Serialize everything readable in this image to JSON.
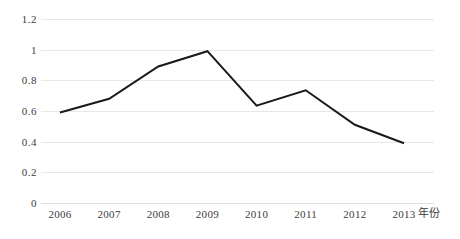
{
  "chart_data": {
    "type": "line",
    "title": "",
    "subtitle": "",
    "xlabel": "年份",
    "ylabel": "",
    "categories": [
      "2006",
      "2007",
      "2008",
      "2009",
      "2010",
      "2011",
      "2012",
      "2013"
    ],
    "x": [
      2006,
      2007,
      2008,
      2009,
      2010,
      2011,
      2012,
      2013
    ],
    "values": [
      0.59,
      0.68,
      0.89,
      0.99,
      0.635,
      0.735,
      0.51,
      0.39
    ],
    "series": [
      {
        "name": "",
        "values": [
          0.59,
          0.68,
          0.89,
          0.99,
          0.635,
          0.735,
          0.51,
          0.39
        ]
      }
    ],
    "ylim": [
      0,
      1.2
    ],
    "y_ticks": [
      0,
      0.2,
      0.4,
      0.6,
      0.8,
      1,
      1.2
    ],
    "y_tick_labels": [
      "0",
      "0.2",
      "0.4",
      "0.6",
      "0.8",
      "1",
      "1.2"
    ],
    "grid": "horizontal",
    "grid_color": "#e6e6e6",
    "legend": "none",
    "legend_position": "none",
    "line_color": "#1a1a1a",
    "line_width": 2,
    "markers": "none",
    "background": "#ffffff",
    "annotations": []
  },
  "axes": {
    "y_labels": [
      "1.2",
      "1",
      "0.8",
      "0.6",
      "0.4",
      "0.2",
      "0"
    ],
    "x_labels": [
      "2006",
      "2007",
      "2008",
      "2009",
      "2010",
      "2011",
      "2012",
      "2013"
    ],
    "x_axis_title": "年份"
  }
}
